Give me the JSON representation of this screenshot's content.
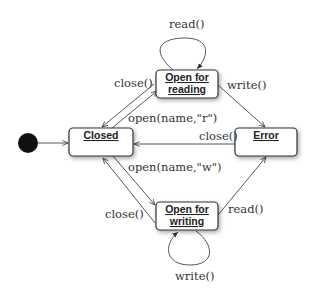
{
  "diagram": {
    "type": "state-machine",
    "initial_state": "Closed",
    "states": [
      {
        "id": "closed",
        "label": "Closed"
      },
      {
        "id": "open_reading",
        "label_line1": "Open for",
        "label_line2": "reading"
      },
      {
        "id": "error",
        "label": "Error"
      },
      {
        "id": "open_writing",
        "label_line1": "Open for",
        "label_line2": "writing"
      }
    ],
    "transitions": [
      {
        "from": "initial",
        "to": "closed",
        "label": ""
      },
      {
        "from": "open_reading",
        "to": "open_reading",
        "label": "read()"
      },
      {
        "from": "open_reading",
        "to": "closed",
        "label": "close()"
      },
      {
        "from": "closed",
        "to": "open_reading",
        "label": "open(name,\"r\")"
      },
      {
        "from": "open_reading",
        "to": "error",
        "label": "write()"
      },
      {
        "from": "error",
        "to": "closed",
        "label": "close()"
      },
      {
        "from": "closed",
        "to": "open_writing",
        "label": "open(name,\"w\")"
      },
      {
        "from": "open_writing",
        "to": "closed",
        "label": "close()"
      },
      {
        "from": "open_writing",
        "to": "error",
        "label": "read()"
      },
      {
        "from": "open_writing",
        "to": "open_writing",
        "label": "write()"
      }
    ]
  }
}
